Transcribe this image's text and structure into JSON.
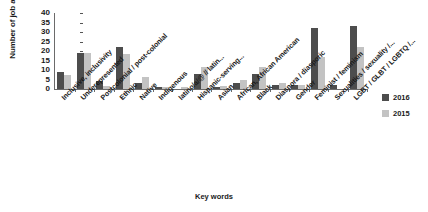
{
  "chart_data": {
    "type": "bar",
    "title": "",
    "xlabel": "Key words",
    "ylabel": "Number of job ads",
    "ylim": [
      0,
      40
    ],
    "yticks": [
      0,
      5,
      10,
      15,
      20,
      25,
      30,
      35,
      40
    ],
    "grid": false,
    "legend_position": "right",
    "categories": [
      "Inclusive, inclusivity",
      "Underepresented",
      "Postcolonial / post-colonial",
      "Ethnic",
      "Native",
      "Indigenous",
      "latino/a/@ // latin...",
      "Hispanic-serving...",
      "Asian",
      "African, African American",
      "Black",
      "Diaspora / diasporic",
      "Gender",
      "Feminist / feminism",
      "Sexualities / sexuality /...",
      "LGBT / GLBT / LGBTQ /..."
    ],
    "series": [
      {
        "name": "2016",
        "color": "#4d4d4d",
        "values": [
          9,
          19,
          4,
          22,
          3,
          1,
          0,
          8,
          1,
          3,
          8,
          2,
          2,
          32,
          2,
          33
        ]
      },
      {
        "name": "2015",
        "color": "#c3c3c3",
        "values": [
          7.5,
          19,
          1.5,
          18.5,
          6.5,
          1,
          1,
          11.5,
          1.5,
          4.5,
          11.5,
          3,
          2,
          17,
          0,
          22
        ]
      }
    ]
  },
  "legend": {
    "items": [
      {
        "label": "2016",
        "color": "#4d4d4d"
      },
      {
        "label": "2015",
        "color": "#c3c3c3"
      }
    ]
  }
}
